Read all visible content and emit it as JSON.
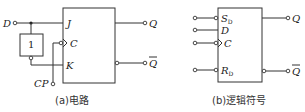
{
  "circuit_a": {
    "caption": "(a)电路",
    "inputs": {
      "d": "D",
      "cp": "CP"
    },
    "inverter_label": "1",
    "ff_pins": {
      "j": "J",
      "c": "C",
      "k": "K"
    },
    "outputs": {
      "q": "Q",
      "qbar": "Q"
    }
  },
  "symbol_b": {
    "caption": "(b)逻辑符号",
    "pins": {
      "sd": "S",
      "sd_sub": "D",
      "d": "D",
      "c": "C",
      "rd": "R",
      "rd_sub": "D"
    },
    "outputs": {
      "q": "Q",
      "qbar": "Q"
    }
  },
  "colors": {
    "line": "#333333",
    "background": "#ffffff"
  }
}
